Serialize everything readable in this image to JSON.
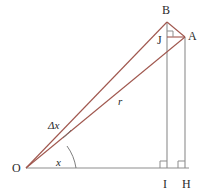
{
  "figure": {
    "kind": "geometry-diagram",
    "colors": {
      "background": "#ffffff",
      "ray_red": "#a0574e",
      "structure_gray": "#8d8d8d",
      "label_text": "#2b2b2b",
      "angle_arc": "#6f6f6f"
    },
    "vertices": [
      {
        "id": "B",
        "label": "B",
        "x": 167,
        "y": 22
      },
      {
        "id": "A",
        "label": "A",
        "x": 185,
        "y": 37
      },
      {
        "id": "J",
        "label": "J",
        "x": 167,
        "y": 37
      },
      {
        "id": "O",
        "label": "O",
        "x": 26,
        "y": 168
      },
      {
        "id": "I",
        "label": "I",
        "x": 167,
        "y": 168
      },
      {
        "id": "H",
        "label": "H",
        "x": 185,
        "y": 168
      }
    ],
    "measures": [
      {
        "id": "r",
        "label": "r",
        "x": 118,
        "y": 96,
        "meaning": "length of segment OA"
      },
      {
        "id": "dx",
        "label": "Δx",
        "x": 48,
        "y": 120,
        "meaning": "angle increment between ray OA and ray OB"
      },
      {
        "id": "x",
        "label": "x",
        "x": 56,
        "y": 157,
        "meaning": "angle between baseline OH and ray OA"
      }
    ],
    "segments": [
      {
        "id": "OB",
        "from": "O",
        "to": "B",
        "style": "ray-red"
      },
      {
        "id": "OA",
        "from": "O",
        "to": "A",
        "style": "ray-red"
      },
      {
        "id": "BA",
        "from": "B",
        "to": "A",
        "style": "ray-red"
      },
      {
        "id": "JA",
        "from": "J",
        "to": "A",
        "style": "ray-red"
      },
      {
        "id": "OH",
        "from": "O",
        "to": "H",
        "style": "structure-gray"
      },
      {
        "id": "BI",
        "from": "B",
        "to": "I",
        "style": "structure-gray"
      },
      {
        "id": "AH",
        "from": "A",
        "to": "H",
        "style": "structure-gray"
      }
    ],
    "right_angles": [
      {
        "id": "angle-at-I",
        "at": "I"
      },
      {
        "id": "angle-at-H",
        "at": "H"
      },
      {
        "id": "angle-at-J",
        "at": "J"
      }
    ],
    "angle_arcs": [
      {
        "id": "arc-x",
        "at": "O",
        "label": "x"
      },
      {
        "id": "arc-dx",
        "at": "O",
        "label": "Δx"
      }
    ]
  }
}
